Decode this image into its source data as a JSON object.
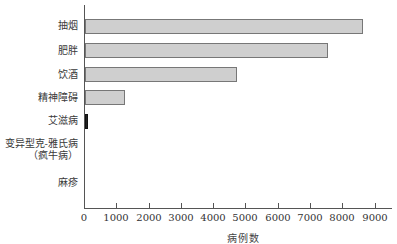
{
  "chart_data": {
    "type": "bar",
    "orientation": "horizontal",
    "title": "",
    "xlabel": "病例数",
    "ylabel": "",
    "categories": [
      "抽烟",
      "肥胖",
      "饮酒",
      "精神障碍",
      "艾滋病",
      "变异型克-雅氏病（疯牛病）",
      "麻疹"
    ],
    "category_lines": [
      [
        "抽烟"
      ],
      [
        "肥胖"
      ],
      [
        "饮酒"
      ],
      [
        "精神障碍"
      ],
      [
        "艾滋病"
      ],
      [
        "变异型克-雅氏病",
        "（疯牛病）"
      ],
      [
        "麻疹"
      ]
    ],
    "values": [
      8600,
      7520,
      4700,
      1240,
      70,
      0,
      0
    ],
    "xlim": [
      0,
      9500
    ],
    "xticks": [
      0,
      1000,
      2000,
      3000,
      4000,
      5000,
      6000,
      7000,
      8000,
      9000
    ],
    "xtick_labels": [
      "0",
      "1000",
      "2000",
      "3000",
      "4000",
      "5000",
      "6000",
      "7000",
      "8000",
      "9000"
    ],
    "grid": false,
    "legend": null,
    "colors": {
      "bar_fill": "#cfcfcf",
      "bar_border": "#777777",
      "highlight_bar": "#222222",
      "axis": "#555555"
    }
  }
}
